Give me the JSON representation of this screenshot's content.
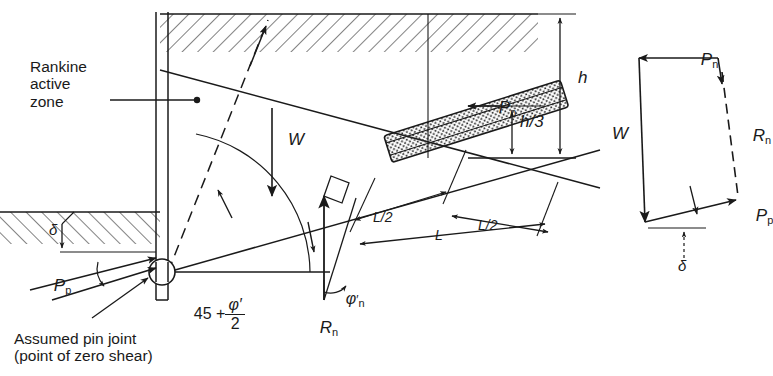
{
  "figure": {
    "kind": "anchored-sheet-pile-wall-free-earth-support-diagram",
    "title": ""
  },
  "labels": {
    "rankine_zone": "Rankine\nactive\nzone",
    "pin_joint": "Assumed pin joint\n(point of zero shear)",
    "weight": "W",
    "passive_force": "P",
    "passive_force_sub": "p",
    "anchor_force": "P",
    "anchor_force_sub": "n",
    "reaction": "R",
    "reaction_sub": "n",
    "height": "h",
    "height_third": "h/3",
    "length_half_left": "L/2",
    "length_full": "L",
    "length_half_right": "L/2",
    "delta": "δ",
    "phi_n": "φ",
    "phi_n_prime": "′",
    "phi_n_sub": "n",
    "angle_45": "45 +",
    "angle_phi_num": "φ′",
    "angle_phi_den": "2"
  },
  "polygon": {
    "caption": "force polygon",
    "vectors": [
      "Pₙ",
      "W",
      "Rₙ",
      "Pₚ"
    ],
    "angle_label": "δ"
  },
  "colors": {
    "ink": "#1a1a1a",
    "paper": "#ffffff",
    "hatch": "#1a1a1a",
    "stipple": "#3a3a3a"
  },
  "geometry": {
    "wall_x": 160,
    "ground_y": 14,
    "dredge_y": 212,
    "pin_y": 272,
    "anchor_angle_deg": -18
  }
}
